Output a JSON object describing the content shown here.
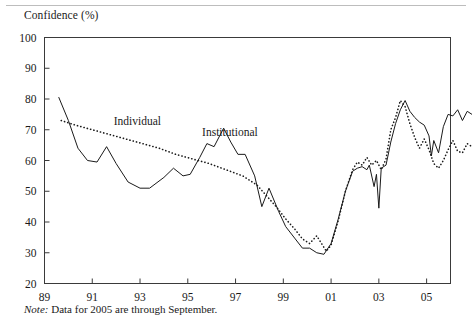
{
  "figure": {
    "axis_title": "Confidence (%)",
    "note_label": "Note:",
    "note_text": " Data for 2005 are through September."
  },
  "chart_data": {
    "type": "line",
    "title": "Confidence (%)",
    "xlabel": "",
    "ylabel": "Confidence (%)",
    "xlim": [
      89,
      106
    ],
    "ylim": [
      20,
      100
    ],
    "grid": false,
    "legend_position": "inline-annotations",
    "yticks": [
      20,
      30,
      40,
      50,
      60,
      70,
      80,
      90,
      100
    ],
    "xticks": [
      89,
      91,
      93,
      95,
      97,
      99,
      101,
      103,
      105
    ],
    "xtick_labels": [
      "89",
      "91",
      "93",
      "95",
      "97",
      "99",
      "01",
      "03",
      "05"
    ],
    "annotations": [
      {
        "text": "Individual",
        "x": 91.9,
        "y": 71.5
      },
      {
        "text": "Institutional",
        "x": 95.6,
        "y": 68.0
      }
    ],
    "series": [
      {
        "name": "Institutional",
        "style": "solid",
        "color": "#1a1a1a",
        "points": [
          [
            89.6,
            80.5
          ],
          [
            90.0,
            73.0
          ],
          [
            90.4,
            64.0
          ],
          [
            90.8,
            60.0
          ],
          [
            91.2,
            59.5
          ],
          [
            91.6,
            64.5
          ],
          [
            92.0,
            59.0
          ],
          [
            92.5,
            53.0
          ],
          [
            93.0,
            51.0
          ],
          [
            93.4,
            51.0
          ],
          [
            94.0,
            54.5
          ],
          [
            94.4,
            57.5
          ],
          [
            94.8,
            55.0
          ],
          [
            95.1,
            55.5
          ],
          [
            95.5,
            61.0
          ],
          [
            95.8,
            65.5
          ],
          [
            96.1,
            64.5
          ],
          [
            96.5,
            70.5
          ],
          [
            96.8,
            66.0
          ],
          [
            97.1,
            62.0
          ],
          [
            97.4,
            62.0
          ],
          [
            97.8,
            55.0
          ],
          [
            98.1,
            45.0
          ],
          [
            98.4,
            51.0
          ],
          [
            98.8,
            43.5
          ],
          [
            99.1,
            38.5
          ],
          [
            99.5,
            34.5
          ],
          [
            99.8,
            31.5
          ],
          [
            100.1,
            31.5
          ],
          [
            100.4,
            30.0
          ],
          [
            100.7,
            29.5
          ],
          [
            101.0,
            33.0
          ],
          [
            101.3,
            41.0
          ],
          [
            101.6,
            50.0
          ],
          [
            101.9,
            56.5
          ],
          [
            102.1,
            57.5
          ],
          [
            102.3,
            58.0
          ],
          [
            102.5,
            57.0
          ],
          [
            102.6,
            58.5
          ],
          [
            102.8,
            51.5
          ],
          [
            102.9,
            55.5
          ],
          [
            103.0,
            44.5
          ],
          [
            103.1,
            57.5
          ],
          [
            103.3,
            58.5
          ],
          [
            103.5,
            66.0
          ],
          [
            103.7,
            72.0
          ],
          [
            103.9,
            76.5
          ],
          [
            104.1,
            79.5
          ],
          [
            104.3,
            76.0
          ],
          [
            104.5,
            74.0
          ],
          [
            104.7,
            72.5
          ],
          [
            104.9,
            71.5
          ],
          [
            105.1,
            68.0
          ],
          [
            105.2,
            61.5
          ],
          [
            105.3,
            66.5
          ],
          [
            105.5,
            62.5
          ],
          [
            105.7,
            71.0
          ],
          [
            105.9,
            75.0
          ],
          [
            106.1,
            74.5
          ],
          [
            106.3,
            76.5
          ],
          [
            106.5,
            73.0
          ],
          [
            106.7,
            76.0
          ],
          [
            106.9,
            75.0
          ]
        ]
      },
      {
        "name": "Individual",
        "style": "dotted",
        "color": "#1a1a1a",
        "points": [
          [
            89.7,
            73.0
          ],
          [
            90.3,
            71.5
          ],
          [
            91.0,
            70.0
          ],
          [
            91.7,
            68.5
          ],
          [
            92.4,
            67.0
          ],
          [
            93.1,
            65.5
          ],
          [
            93.8,
            64.0
          ],
          [
            94.5,
            62.0
          ],
          [
            95.2,
            60.5
          ],
          [
            95.9,
            59.0
          ],
          [
            96.6,
            57.0
          ],
          [
            97.3,
            55.0
          ],
          [
            97.9,
            52.0
          ],
          [
            98.3,
            48.5
          ],
          [
            98.7,
            45.0
          ],
          [
            99.1,
            41.0
          ],
          [
            99.5,
            37.5
          ],
          [
            99.8,
            34.5
          ],
          [
            100.1,
            33.0
          ],
          [
            100.4,
            35.5
          ],
          [
            100.6,
            33.0
          ],
          [
            100.8,
            30.5
          ],
          [
            101.0,
            32.5
          ],
          [
            101.3,
            40.5
          ],
          [
            101.6,
            50.0
          ],
          [
            101.9,
            57.0
          ],
          [
            102.1,
            59.5
          ],
          [
            102.3,
            58.5
          ],
          [
            102.5,
            61.0
          ],
          [
            102.7,
            58.5
          ],
          [
            102.9,
            60.0
          ],
          [
            103.1,
            57.0
          ],
          [
            103.3,
            60.5
          ],
          [
            103.5,
            70.0
          ],
          [
            103.7,
            74.0
          ],
          [
            103.9,
            79.5
          ],
          [
            104.1,
            77.5
          ],
          [
            104.3,
            72.0
          ],
          [
            104.5,
            67.5
          ],
          [
            104.7,
            64.0
          ],
          [
            104.9,
            67.0
          ],
          [
            105.1,
            63.5
          ],
          [
            105.3,
            59.0
          ],
          [
            105.5,
            57.5
          ],
          [
            105.7,
            60.0
          ],
          [
            105.9,
            63.5
          ],
          [
            106.1,
            66.5
          ],
          [
            106.3,
            63.0
          ],
          [
            106.5,
            62.5
          ],
          [
            106.7,
            65.5
          ],
          [
            106.9,
            64.5
          ]
        ]
      }
    ]
  }
}
